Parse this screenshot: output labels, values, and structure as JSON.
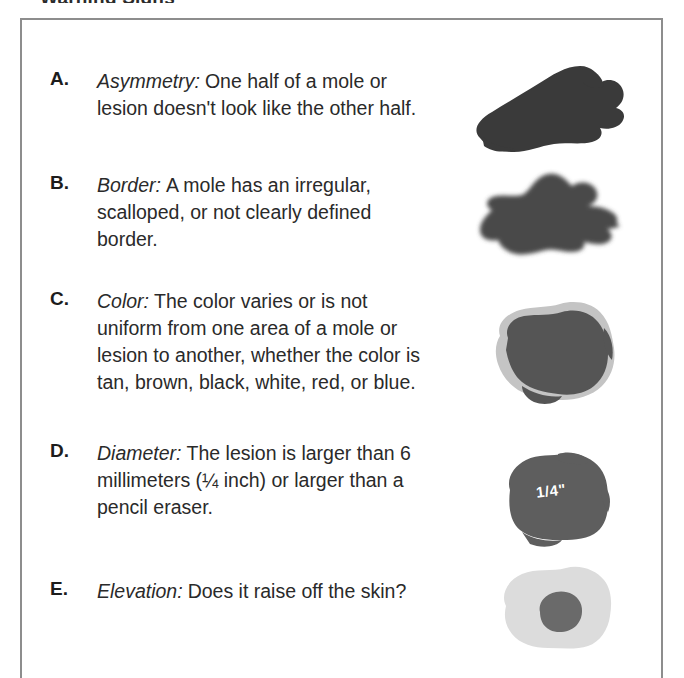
{
  "cropped_heading": "Warning Signs",
  "box": {
    "border_color": "#8d8d8d"
  },
  "items": [
    {
      "letter": "A.",
      "term": "Asymmetry:",
      "description": "One half of a mole or lesion doesn't look like the other half.",
      "figure_name": "asymmetric-mole-illustration",
      "figure_fill": "#3a3a3a",
      "figure_caption": ""
    },
    {
      "letter": "B.",
      "term": "Border:",
      "description": "A mole has an irregular, scalloped, or not clearly defined border.",
      "figure_name": "irregular-border-mole-illustration",
      "figure_fill": "#4a4a4a",
      "figure_caption": ""
    },
    {
      "letter": "C.",
      "term": "Color:",
      "description": "The color varies or is not uniform from one area of a mole or lesion to another, whether the color is tan, brown, black, white, red, or blue.",
      "figure_name": "varied-color-mole-illustration",
      "figure_fill": "#555555",
      "figure_halo_fill": "#c4c4c4",
      "figure_caption": ""
    },
    {
      "letter": "D.",
      "term": "Diameter:",
      "description": "The lesion is larger than 6 millimeters (¼ inch) or larger than a pencil eraser.",
      "figure_name": "large-diameter-mole-illustration",
      "figure_fill": "#5e5e5e",
      "figure_caption": "1/4\""
    },
    {
      "letter": "E.",
      "term": "Elevation:",
      "description": "Does it raise off the skin?",
      "figure_name": "elevated-mole-illustration",
      "figure_fill": "#6a6a6a",
      "figure_halo_fill": "#dcdcdc",
      "figure_caption": ""
    }
  ]
}
